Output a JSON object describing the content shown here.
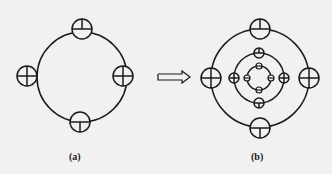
{
  "figure": {
    "panel_a": {
      "label": "(a)",
      "main_circle": {
        "cx": 82,
        "cy": 77,
        "r": 45
      },
      "markers": [
        {
          "pos": "top",
          "cx": 82,
          "cy": 29,
          "r": 10
        },
        {
          "pos": "right",
          "cx": 123,
          "cy": 76,
          "r": 10
        },
        {
          "pos": "bottom",
          "cx": 78,
          "cy": 122,
          "r": 10
        },
        {
          "pos": "left",
          "cx": 27,
          "cy": 76,
          "r": 10
        }
      ]
    },
    "arrow": {
      "direction": "right",
      "meaning": "transforms-to"
    },
    "panel_b": {
      "label": "(b)",
      "rings": [
        {
          "cx": 260,
          "cy": 78,
          "r": 49
        },
        {
          "cx": 260,
          "cy": 78,
          "r": 25
        },
        {
          "cx": 260,
          "cy": 78,
          "r": 13
        }
      ]
    },
    "colors": {
      "line": "#1a1a1a",
      "background": "#f1f1f1"
    }
  }
}
